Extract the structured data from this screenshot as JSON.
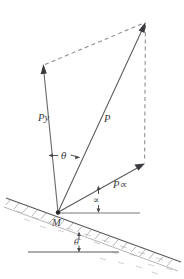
{
  "figure": {
    "type": "free-body-vector-diagram",
    "background_color": "#ffffff",
    "stroke_color": "#5a5a5e",
    "dash_color": "#8a8a8e"
  },
  "labels": {
    "origin": "M",
    "resultant": "P",
    "vertical_component": "Py",
    "incline_component": "P∝",
    "incline_component_base": "P",
    "incline_component_greek": "∝",
    "angle_between_py_and_p": "θ",
    "angle_palpha_to_horizontal": "∝",
    "angle_incline_to_horizontal": "θ"
  },
  "geometry": {
    "origin_point": {
      "x": 58,
      "y": 213
    },
    "apex_point": {
      "x": 145,
      "y": 23
    },
    "py_tip": {
      "x": 43.5,
      "y": 66
    },
    "palpha_tip": {
      "x": 144,
      "y": 165
    },
    "incline_start": {
      "x": 6,
      "y": 198
    },
    "incline_end": {
      "x": 181,
      "y": 262
    },
    "horizontal_ref_at_m": {
      "x1": 58,
      "y1": 213,
      "x2": 140,
      "y2": 213
    },
    "lower_horizontal_ref": {
      "x1": 28,
      "y1": 252,
      "x2": 119,
      "y2": 252
    }
  },
  "vectors": [
    {
      "name": "Py",
      "label": "Py",
      "from": "M",
      "to": "py_tip",
      "style": "solid-arrow"
    },
    {
      "name": "P",
      "label": "P",
      "from": "M",
      "to": "apex",
      "style": "solid-arrow"
    },
    {
      "name": "Palpha",
      "label": "P∝",
      "from": "M",
      "to": "palpha_tip",
      "style": "solid-arrow"
    }
  ],
  "construction_lines": [
    {
      "name": "py-tip-to-apex",
      "style": "dashed"
    },
    {
      "name": "apex-to-palpha-tip",
      "style": "dashed"
    }
  ],
  "angles": [
    {
      "name": "theta-py-p",
      "symbol": "θ",
      "between": [
        "Py",
        "P"
      ],
      "at": "M"
    },
    {
      "name": "alpha-palpha-horizontal",
      "symbol": "∝",
      "between": [
        "P∝",
        "horizontal"
      ],
      "at": "M"
    },
    {
      "name": "theta-incline-horizontal",
      "symbol": "θ",
      "between": [
        "incline",
        "horizontal"
      ],
      "at": "incline"
    }
  ]
}
